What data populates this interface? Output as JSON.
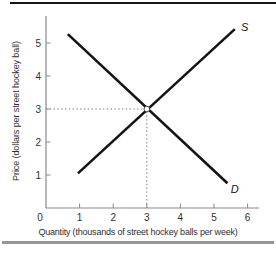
{
  "figure": {
    "colors": {
      "background": "#ffffff",
      "curve": "#141414",
      "axis": "#8a8a8a",
      "tick_label": "#2f2f2f",
      "guide": "#7a7a7a",
      "top_rule": "#161616",
      "bottom_rule": "#969696",
      "marker_fill": "#ffffff",
      "marker_stroke": "#3a3a3a"
    }
  },
  "chart_data": {
    "type": "line",
    "title": "",
    "xlabel": "Quantity (thousands of street hockey balls per week)",
    "ylabel": "Price (dollars per street hockey ball)",
    "xlim": [
      0,
      6.35
    ],
    "ylim": [
      0,
      5.8
    ],
    "x_ticks": [
      0,
      1,
      2,
      3,
      4,
      5,
      6
    ],
    "y_ticks": [
      1,
      2,
      3,
      4,
      5
    ],
    "grid": false,
    "legend_position": "inline-curve-labels",
    "series": [
      {
        "name": "supply",
        "label": "S",
        "points": [
          [
            0.95,
            1.05
          ],
          [
            5.62,
            5.42
          ]
        ],
        "label_pos": [
          5.8,
          5.35
        ]
      },
      {
        "name": "demand",
        "label": "D",
        "points": [
          [
            0.65,
            5.27
          ],
          [
            5.4,
            0.75
          ]
        ],
        "label_pos": [
          5.5,
          0.45
        ]
      }
    ],
    "equilibrium": {
      "quantity": 3,
      "price": 3,
      "marker": "open-circle",
      "guides": "dotted-lines-to-both-axes"
    }
  }
}
